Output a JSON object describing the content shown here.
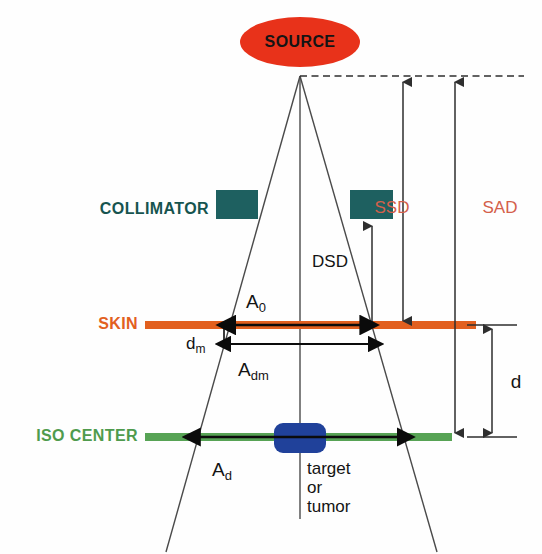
{
  "figure": {
    "type": "diagram"
  },
  "colors": {
    "source_fill": "#e8321a",
    "source_text": "#1a1a1a",
    "collimator_fill": "#1e6060",
    "collimator_text": "#16544f",
    "skin_line": "#e2601f",
    "skin_text": "#e2601f",
    "iso_line": "#57a355",
    "iso_text": "#4f9b4d",
    "target_fill": "#20419a",
    "distance_label": "#d4604b",
    "line": "#3b3b3b",
    "arrow": "#111111",
    "background": "#ffffff"
  },
  "labels": {
    "source": "SOURCE",
    "collimator": "COLLIMATOR",
    "skin": "SKIN",
    "iso_center": "ISO CENTER",
    "ssd": "SSD",
    "sad": "SAD",
    "dsd": "DSD",
    "depth": "d"
  },
  "field_sizes": {
    "a0": {
      "base": "A",
      "sub": "0"
    },
    "adm": {
      "base": "A",
      "sub": "dm"
    },
    "ad": {
      "base": "A",
      "sub": "d"
    },
    "dm": {
      "base": "d",
      "sub": "m"
    }
  },
  "target": {
    "line1": "target",
    "line2": "or",
    "line3": "tumor"
  },
  "geometry_notes": {
    "source_apex_x": 300,
    "source_apex_y": 76,
    "skin_level_y": 325,
    "iso_level_y": 437,
    "collimator_level_y": 204,
    "ssd_axis_x": 403,
    "sad_axis_x": 455,
    "dsd_axis_x": 372,
    "depth_axis_x": 492
  }
}
